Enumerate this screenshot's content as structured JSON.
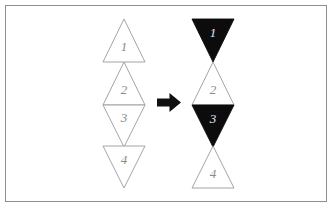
{
  "figure": {
    "frame": {
      "stroke_color": "#8e8e8e",
      "background": "#ffffff"
    },
    "colors": {
      "outline_stroke": "#9a9a9a",
      "fill_white": "#ffffff",
      "fill_black": "#0c0c0c",
      "label_on_white": "#8a8a8a",
      "label_on_black": "#e8e8e8",
      "arrow": "#101010"
    },
    "left_group": {
      "name": "before-stack",
      "center_x": 124,
      "half_width": 21,
      "triangles": [
        {
          "label": "1",
          "direction": "up",
          "fill": "white",
          "top": 19,
          "bottom": 62,
          "label_x": 124,
          "label_y": 48
        },
        {
          "label": "2",
          "direction": "up",
          "fill": "white",
          "top": 62,
          "bottom": 105,
          "label_x": 124,
          "label_y": 91
        },
        {
          "label": "3",
          "direction": "down",
          "fill": "white",
          "top": 105,
          "bottom": 147,
          "label_x": 124,
          "label_y": 119
        },
        {
          "label": "4",
          "direction": "down",
          "fill": "white",
          "top": 146,
          "bottom": 188,
          "label_x": 124,
          "label_y": 161
        }
      ]
    },
    "right_group": {
      "name": "after-stack",
      "center_x": 213,
      "half_width": 21,
      "triangles": [
        {
          "label": "1",
          "direction": "down",
          "fill": "black",
          "top": 19,
          "bottom": 62,
          "label_x": 213,
          "label_y": 34
        },
        {
          "label": "2",
          "direction": "up",
          "fill": "white",
          "top": 62,
          "bottom": 105,
          "label_x": 213,
          "label_y": 91
        },
        {
          "label": "3",
          "direction": "down",
          "fill": "black",
          "top": 105,
          "bottom": 147,
          "label_x": 213,
          "label_y": 120
        },
        {
          "label": "4",
          "direction": "up",
          "fill": "white",
          "top": 146,
          "bottom": 188,
          "label_x": 213,
          "label_y": 175
        }
      ]
    },
    "arrow": {
      "name": "transformation-arrow",
      "direction": "right",
      "x": 157,
      "y": 93,
      "width": 24,
      "height": 19
    }
  }
}
